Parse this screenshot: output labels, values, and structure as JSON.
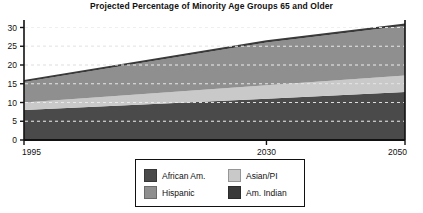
{
  "chart_data": {
    "type": "area",
    "title": "Projected Percentage of Minority Age Groups 65 and Older",
    "xlabel": "",
    "ylabel": "",
    "stacked": true,
    "grid": true,
    "legend_position": "bottom-center",
    "x": [
      1995,
      2030,
      2050
    ],
    "xlim": [
      1995,
      2050
    ],
    "ylim": [
      0,
      32
    ],
    "xticks": [
      "1995",
      "2030",
      "2050"
    ],
    "yticks": [
      "0",
      "5",
      "10",
      "15",
      "20",
      "25",
      "30"
    ],
    "ytick_values": [
      0,
      5,
      10,
      15,
      20,
      25,
      30
    ],
    "series": [
      {
        "name": "African Am.",
        "color": "#4a4a4a",
        "values": [
          8.0,
          11.0,
          12.8
        ]
      },
      {
        "name": "Asian/PI",
        "color": "#c9c9c9",
        "values": [
          2.0,
          3.6,
          4.4
        ]
      },
      {
        "name": "Hispanic",
        "color": "#8f8f8f",
        "values": [
          5.5,
          11.4,
          13.3
        ]
      },
      {
        "name": "Am. Indian",
        "color": "#3a3a3a",
        "values": [
          0.5,
          0.6,
          0.6
        ]
      }
    ],
    "totals": [
      16.0,
      26.6,
      31.1
    ]
  },
  "legend": {
    "entries": [
      {
        "label": "African Am.",
        "color": "#4a4a4a"
      },
      {
        "label": "Asian/PI",
        "color": "#c9c9c9"
      },
      {
        "label": "Hispanic",
        "color": "#8f8f8f"
      },
      {
        "label": "Am. Indian",
        "color": "#3a3a3a"
      }
    ]
  },
  "axis": {
    "y_labels": [
      "30",
      "25",
      "20",
      "15",
      "10",
      "5",
      "0"
    ],
    "x_labels": [
      "1995",
      "2030",
      "2050"
    ]
  }
}
